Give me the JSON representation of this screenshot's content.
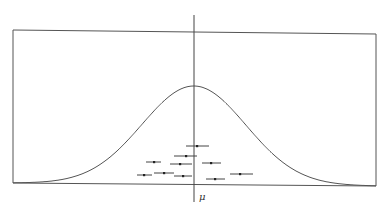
{
  "diagram": {
    "title": "",
    "mean_label": "μ",
    "colors": {
      "background": "#ffffff",
      "stroke": "#555555",
      "points": "#222222"
    },
    "frame": {
      "left": 13,
      "right": 376,
      "top_left": 30,
      "top_right": 34,
      "bottom_left": 183,
      "bottom_right": 186
    },
    "mean_line": {
      "x": 194,
      "y_top": 15,
      "y_bottom": 202
    },
    "curve": {
      "peak_x": 194,
      "peak_y": 86,
      "sigma_px": 52
    },
    "label_position": {
      "x": 199,
      "y": 191
    }
  },
  "chart_data": {
    "type": "scatter",
    "title": "",
    "xlabel": "μ",
    "ylabel": "",
    "grid": false,
    "curve": "normal density centered at μ",
    "points": [
      {
        "x": 197,
        "y": 146,
        "lo": 186,
        "hi": 209
      },
      {
        "x": 186,
        "y": 156,
        "lo": 174,
        "hi": 197
      },
      {
        "x": 154,
        "y": 162,
        "lo": 146,
        "hi": 161
      },
      {
        "x": 180,
        "y": 164,
        "lo": 170,
        "hi": 192
      },
      {
        "x": 211,
        "y": 163,
        "lo": 202,
        "hi": 221
      },
      {
        "x": 144,
        "y": 175,
        "lo": 137,
        "hi": 152
      },
      {
        "x": 164,
        "y": 173,
        "lo": 154,
        "hi": 174
      },
      {
        "x": 183,
        "y": 176,
        "lo": 174,
        "hi": 192
      },
      {
        "x": 240,
        "y": 174,
        "lo": 230,
        "hi": 253
      },
      {
        "x": 215,
        "y": 179,
        "lo": 206,
        "hi": 225
      }
    ]
  }
}
